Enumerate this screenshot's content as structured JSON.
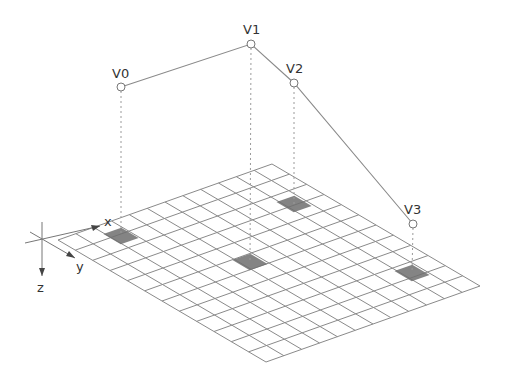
{
  "diagram": {
    "colors": {
      "grid_line": "#8a8a8a",
      "polyline": "#8a8a8a",
      "dotted": "#9a9a9a",
      "shade": "#6f6f6f",
      "text": "#333333"
    },
    "axes": {
      "x_label": "x",
      "y_label": "y",
      "z_label": "z"
    },
    "grid": {
      "cells_x": 12,
      "cells_y": 12,
      "corner_left": [
        58,
        240
      ],
      "corner_top": [
        272,
        164
      ],
      "corner_bottom": [
        266,
        362
      ]
    },
    "vertices": [
      {
        "label": "V0",
        "point": [
          121,
          87
        ],
        "foot": [
          121,
          236
        ],
        "label_pos": [
          112,
          78
        ]
      },
      {
        "label": "V1",
        "point": [
          251,
          44
        ],
        "foot": [
          250,
          262
        ],
        "label_pos": [
          243,
          34
        ]
      },
      {
        "label": "V2",
        "point": [
          294,
          83
        ],
        "foot": [
          294,
          204
        ],
        "label_pos": [
          286,
          73
        ]
      },
      {
        "label": "V3",
        "point": [
          413,
          224
        ],
        "foot": [
          412,
          273
        ],
        "label_pos": [
          404,
          214
        ]
      }
    ]
  }
}
